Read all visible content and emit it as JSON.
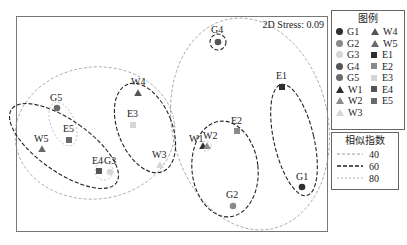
{
  "chart_data": {
    "type": "scatter",
    "title": "",
    "subtitle": "NMDS ordination",
    "annotation": "2D Stress: 0.09",
    "xlabel": "",
    "ylabel": "",
    "grid": false,
    "legend_position": "right",
    "points": [
      {
        "id": "G1",
        "group": "G",
        "shape": "circle",
        "color": "#2e2e2e",
        "x": 302,
        "y": 187
      },
      {
        "id": "G2",
        "group": "G",
        "shape": "circle",
        "color": "#8a8a8a",
        "x": 233,
        "y": 206
      },
      {
        "id": "G3",
        "group": "G",
        "shape": "circle",
        "color": "#d6d6d6",
        "x": 110,
        "y": 172
      },
      {
        "id": "G4",
        "group": "G",
        "shape": "circle",
        "color": "#555555",
        "x": 218,
        "y": 42
      },
      {
        "id": "G5",
        "group": "G",
        "shape": "circle",
        "color": "#6a6a6a",
        "x": 57,
        "y": 108
      },
      {
        "id": "W1",
        "group": "W",
        "shape": "triangle",
        "color": "#2e2e2e",
        "x": 203,
        "y": 146
      },
      {
        "id": "W2",
        "group": "W",
        "shape": "triangle",
        "color": "#8a8a8a",
        "x": 207,
        "y": 146
      },
      {
        "id": "W3",
        "group": "W",
        "shape": "triangle",
        "color": "#d6d6d6",
        "x": 160,
        "y": 165
      },
      {
        "id": "W4",
        "group": "W",
        "shape": "triangle",
        "color": "#555555",
        "x": 138,
        "y": 93
      },
      {
        "id": "W5",
        "group": "W",
        "shape": "triangle",
        "color": "#6a6a6a",
        "x": 42,
        "y": 149
      },
      {
        "id": "E1",
        "group": "E",
        "shape": "square",
        "color": "#2e2e2e",
        "x": 282,
        "y": 87
      },
      {
        "id": "E2",
        "group": "E",
        "shape": "square",
        "color": "#8a8a8a",
        "x": 237,
        "y": 131
      },
      {
        "id": "E3",
        "group": "E",
        "shape": "square",
        "color": "#d6d6d6",
        "x": 133,
        "y": 125
      },
      {
        "id": "E4",
        "group": "E",
        "shape": "square",
        "color": "#555555",
        "x": 99,
        "y": 171
      },
      {
        "id": "E5",
        "group": "E",
        "shape": "square",
        "color": "#6a6a6a",
        "x": 69,
        "y": 140
      }
    ],
    "labels": [
      {
        "text": "G1",
        "x": 296,
        "y": 180
      },
      {
        "text": "G2",
        "x": 226,
        "y": 198
      },
      {
        "text": "G3",
        "x": 104,
        "y": 164
      },
      {
        "text": "G4",
        "x": 211,
        "y": 33
      },
      {
        "text": "G5",
        "x": 50,
        "y": 101
      },
      {
        "text": "W1",
        "x": 189,
        "y": 142
      },
      {
        "text": "W2",
        "x": 203,
        "y": 139
      },
      {
        "text": "W3",
        "x": 152,
        "y": 158
      },
      {
        "text": "W4",
        "x": 131,
        "y": 85
      },
      {
        "text": "W5",
        "x": 34,
        "y": 142
      },
      {
        "text": "E1",
        "x": 276,
        "y": 79
      },
      {
        "text": "E2",
        "x": 231,
        "y": 124
      },
      {
        "text": "E3",
        "x": 127,
        "y": 117
      },
      {
        "text": "E4",
        "x": 92,
        "y": 164
      },
      {
        "text": "E5",
        "x": 63,
        "y": 132
      }
    ],
    "similarity_contours": [
      {
        "level": 40,
        "members": [
          "G4",
          "E1",
          "E2",
          "W1",
          "W2",
          "G2",
          "G1"
        ],
        "cx": 250,
        "cy": 124,
        "rx": 78,
        "ry": 107,
        "rot": -12
      },
      {
        "level": 40,
        "members": [
          "G5",
          "W5",
          "E5",
          "E4",
          "G3",
          "W4",
          "E3",
          "W3"
        ],
        "cx": 95,
        "cy": 133,
        "rx": 80,
        "ry": 66,
        "rot": -6
      },
      {
        "level": 60,
        "members": [
          "G5",
          "W5",
          "E5",
          "E4",
          "G3"
        ],
        "cx": 64,
        "cy": 146,
        "rx": 26,
        "ry": 64,
        "rot": -55
      },
      {
        "level": 60,
        "members": [
          "W4",
          "E3",
          "W3"
        ],
        "cx": 145,
        "cy": 128,
        "rx": 27,
        "ry": 47,
        "rot": -22
      },
      {
        "level": 60,
        "members": [
          "W1",
          "W2",
          "E2",
          "G2"
        ],
        "cx": 225,
        "cy": 169,
        "rx": 33,
        "ry": 48,
        "rot": -6
      },
      {
        "level": 60,
        "members": [
          "E1",
          "G1"
        ],
        "cx": 294,
        "cy": 140,
        "rx": 20,
        "ry": 57,
        "rot": -13
      },
      {
        "level": 60,
        "members": [
          "G4"
        ],
        "cx": 218,
        "cy": 42,
        "rx": 8,
        "ry": 8,
        "rot": 0
      },
      {
        "level": 80,
        "members": [
          "G5",
          "E5"
        ],
        "cx": 63,
        "cy": 124,
        "rx": 12,
        "ry": 23,
        "rot": -22
      },
      {
        "level": 80,
        "members": [
          "E4",
          "G3"
        ],
        "cx": 104,
        "cy": 171,
        "rx": 9,
        "ry": 9,
        "rot": 0
      },
      {
        "level": 80,
        "members": [
          "W1",
          "W2"
        ],
        "cx": 206,
        "cy": 146,
        "rx": 5,
        "ry": 5,
        "rot": 0
      }
    ],
    "legend": {
      "title": "图例",
      "entries": [
        "G1",
        "G2",
        "G3",
        "G4",
        "G5",
        "W1",
        "W2",
        "W3",
        "W4",
        "W5",
        "E1",
        "E2",
        "E3",
        "E4",
        "E5"
      ]
    },
    "similarity_legend": {
      "title": "相似指数",
      "entries": [
        {
          "label": "40",
          "color": "#9a9a9a",
          "dash": "3,2",
          "width": 0.8
        },
        {
          "label": "60",
          "color": "#222222",
          "dash": "4,2",
          "width": 1.1
        },
        {
          "label": "80",
          "color": "#b5b5b5",
          "dash": "2,2",
          "width": 0.8
        }
      ]
    }
  },
  "legend": {
    "title": "图例",
    "col1": [
      {
        "label": "G1",
        "shape": "circle",
        "color": "#2e2e2e"
      },
      {
        "label": "G2",
        "shape": "circle",
        "color": "#8a8a8a"
      },
      {
        "label": "G3",
        "shape": "circle",
        "color": "#d6d6d6"
      },
      {
        "label": "G4",
        "shape": "circle",
        "color": "#555555"
      },
      {
        "label": "G5",
        "shape": "circle",
        "color": "#6a6a6a"
      },
      {
        "label": "W1",
        "shape": "triangle",
        "color": "#2e2e2e"
      },
      {
        "label": "W2",
        "shape": "triangle",
        "color": "#8a8a8a"
      },
      {
        "label": "W3",
        "shape": "triangle",
        "color": "#d6d6d6"
      }
    ],
    "col2": [
      {
        "label": "W4",
        "shape": "triangle",
        "color": "#555555"
      },
      {
        "label": "W5",
        "shape": "triangle",
        "color": "#6a6a6a"
      },
      {
        "label": "E1",
        "shape": "square",
        "color": "#2e2e2e"
      },
      {
        "label": "E2",
        "shape": "square",
        "color": "#8a8a8a"
      },
      {
        "label": "E3",
        "shape": "square",
        "color": "#d6d6d6"
      },
      {
        "label": "E4",
        "shape": "square",
        "color": "#555555"
      },
      {
        "label": "E5",
        "shape": "square",
        "color": "#6a6a6a"
      }
    ]
  },
  "similarity": {
    "title": "相似指数",
    "entries": [
      {
        "label": "40"
      },
      {
        "label": "60"
      },
      {
        "label": "80"
      }
    ]
  },
  "plot": {
    "stress_label": "2D Stress: 0.09"
  }
}
